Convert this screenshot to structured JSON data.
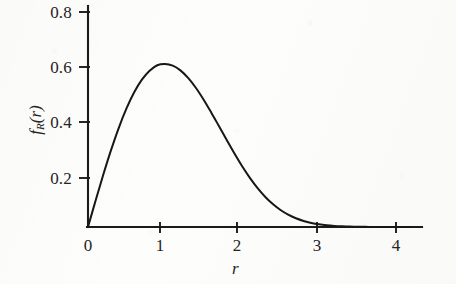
{
  "figure": {
    "background_color": "#fdfdfb",
    "ink_color": "#1b1b1b",
    "x_axis_title": "r",
    "y_axis_title_base": "f",
    "y_axis_title_sub": "R",
    "y_axis_title_arg": "(r)"
  },
  "chart_data": {
    "type": "line",
    "title": "",
    "subtitle": "",
    "xlabel": "r",
    "ylabel": "f_R(r)",
    "xlim": [
      0,
      4.2
    ],
    "ylim": [
      0,
      0.85
    ],
    "grid": false,
    "legend": null,
    "annotations": [],
    "xticks": [
      0,
      1,
      2,
      3,
      4
    ],
    "xticklabels": [
      "0",
      "1",
      "2",
      "3",
      "4"
    ],
    "yticks": [
      0.2,
      0.4,
      0.6,
      0.8
    ],
    "yticklabels": [
      "0.2",
      "0.4",
      "0.6",
      "0.8"
    ],
    "series": [
      {
        "name": "Rayleigh density f_R(r) = r exp(-r^2/2)",
        "color": "#171717",
        "linewidth": 2.0,
        "x": [
          0.0,
          0.1,
          0.2,
          0.3,
          0.4,
          0.5,
          0.6,
          0.7,
          0.8,
          0.9,
          1.0,
          1.1,
          1.2,
          1.3,
          1.4,
          1.5,
          1.6,
          1.7,
          1.8,
          1.9,
          2.0,
          2.1,
          2.2,
          2.3,
          2.4,
          2.5,
          2.6,
          2.7,
          2.8,
          2.9,
          3.0,
          3.1,
          3.2,
          3.3,
          3.4,
          3.5,
          3.6,
          3.7,
          3.8,
          3.9,
          4.0,
          4.1,
          4.2
        ],
        "y": [
          0.0,
          0.0995,
          0.196,
          0.2868,
          0.3692,
          0.4412,
          0.5011,
          0.5481,
          0.5816,
          0.6019,
          0.6065,
          0.6004,
          0.5828,
          0.5548,
          0.5182,
          0.4747,
          0.4265,
          0.3758,
          0.3244,
          0.2742,
          0.2271,
          0.1839,
          0.1457,
          0.1128,
          0.0854,
          0.0633,
          0.0459,
          0.0325,
          0.0225,
          0.0152,
          0.01,
          0.0065,
          0.0041,
          0.0025,
          0.0015,
          0.0009,
          0.0005,
          0.0003,
          0.0002,
          0.0001,
          5e-05,
          3e-05,
          1e-05
        ]
      }
    ],
    "peak": {
      "x": 1.0,
      "y": 0.6065
    }
  },
  "ytick_labels": [
    {
      "text": "0.8",
      "value": 0.8
    },
    {
      "text": "0.6",
      "value": 0.6
    },
    {
      "text": "0.4",
      "value": 0.4
    },
    {
      "text": "0.2",
      "value": 0.2
    }
  ],
  "xtick_labels": [
    {
      "text": "0",
      "value": 0
    },
    {
      "text": "1",
      "value": 1
    },
    {
      "text": "2",
      "value": 2
    },
    {
      "text": "3",
      "value": 3
    },
    {
      "text": "4",
      "value": 4
    }
  ]
}
